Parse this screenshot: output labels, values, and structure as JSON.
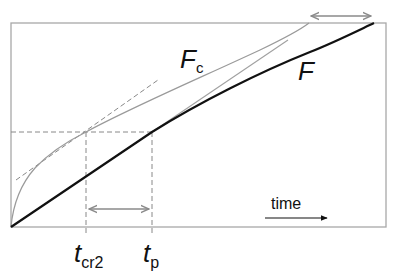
{
  "diagram": {
    "type": "time-evolution-sketch",
    "curves": [
      {
        "name": "F",
        "style": "thick black solid"
      },
      {
        "name": "Fc",
        "style": "thin gray solid"
      }
    ],
    "guides": [
      {
        "name": "tangent-to-Fc",
        "style": "gray dashed"
      },
      {
        "name": "tangent-to-F",
        "style": "thin gray solid"
      },
      {
        "name": "horizontal-level",
        "style": "gray dashed"
      },
      {
        "name": "vline-tcr2",
        "style": "gray dashed"
      },
      {
        "name": "vline-tp",
        "style": "gray dashed"
      }
    ],
    "colors": {
      "F": "#111111",
      "Fc": "#9a9a9a",
      "frame": "#a8a8a8",
      "dashed": "#888888",
      "arrow": "#8a8a8a"
    }
  },
  "labels": {
    "curve_fc_main": "F",
    "curve_fc_sub": "c",
    "curve_f": "F",
    "axis_time": "time",
    "tick_tcr2_main": "t",
    "tick_tcr2_sub": "cr2",
    "tick_tp_main": "t",
    "tick_tp_sub": "p"
  }
}
